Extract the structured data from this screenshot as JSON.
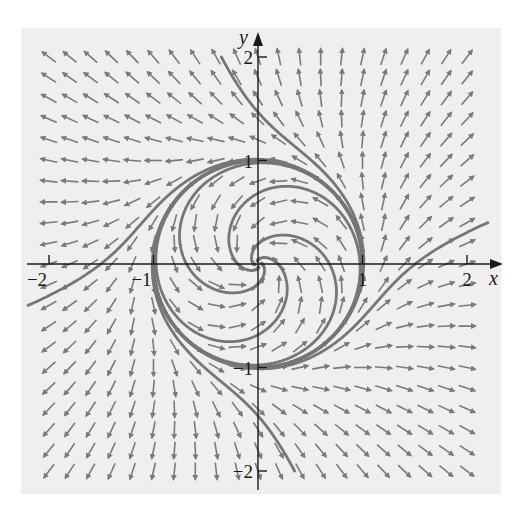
{
  "figure": {
    "type": "phase-portrait",
    "system": {
      "dx_dt": "-y + x(x^2 + y^2 - 1)",
      "dy_dt": "x + y(x^2 + y^2 - 1)"
    },
    "x_axis": {
      "name": "x",
      "ticks": [
        -2,
        -1,
        1,
        2
      ],
      "tick_labels": [
        "−2",
        "−1",
        "1",
        "2"
      ],
      "range": [
        -2.2,
        2.2
      ]
    },
    "y_axis": {
      "name": "y",
      "ticks": [
        -2,
        -1,
        1,
        2
      ],
      "tick_labels": [
        "−2",
        "−1",
        "1",
        "2"
      ],
      "range": [
        -2.2,
        2.2
      ]
    },
    "limit_cycle_radius": 1,
    "field_grid": {
      "min": -2.0,
      "max": 2.0,
      "step": 0.2
    },
    "inner_spiral_arms": 4,
    "outer_trajectories": 4,
    "colors": {
      "panel": "#efefef",
      "arrow": "#7a7a7a",
      "trajectory": "#767676",
      "axis": "#1a1a1a",
      "text": "#1a1a1a"
    }
  },
  "chart_data": {
    "type": "vector-field",
    "title": "",
    "xlabel": "x",
    "ylabel": "y",
    "xlim": [
      -2.2,
      2.2
    ],
    "ylim": [
      -2.2,
      2.2
    ],
    "x_tick_labels": [
      "−2",
      "−1",
      "1",
      "2"
    ],
    "y_tick_labels": [
      "−2",
      "−1",
      "1",
      "2"
    ],
    "limit_cycle": {
      "shape": "circle",
      "radius": 1,
      "center": [
        0,
        0
      ]
    },
    "trajectories": [
      {
        "name": "inner-spiral",
        "from": [
          0,
          0
        ],
        "to": "limit cycle",
        "arms": 4
      },
      {
        "name": "outer-top",
        "start": [
          -0.35,
          2.0
        ]
      },
      {
        "name": "outer-right",
        "start": [
          2.2,
          0.4
        ]
      },
      {
        "name": "outer-bottom",
        "start": [
          0.35,
          -2.0
        ]
      },
      {
        "name": "outer-left",
        "start": [
          -2.2,
          -0.4
        ]
      }
    ],
    "grid": false
  }
}
